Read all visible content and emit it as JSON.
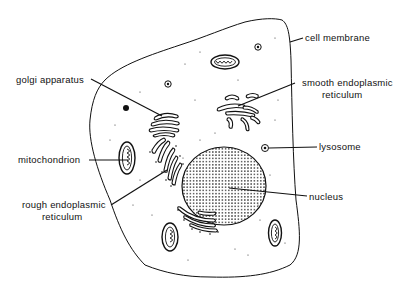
{
  "diagram": {
    "colors": {
      "ink": "#111111",
      "background": "#ffffff"
    },
    "labels": {
      "cell_membrane": "cell membrane",
      "golgi_apparatus": "golgi apparatus",
      "smooth_er_line1": "smooth endoplasmic",
      "smooth_er_line2": "reticulum",
      "lysosome": "lysosome",
      "mitochondrion": "mitochondrion",
      "nucleus": "nucleus",
      "rough_er_line1": "rough endoplasmic",
      "rough_er_line2": "reticulum"
    }
  }
}
